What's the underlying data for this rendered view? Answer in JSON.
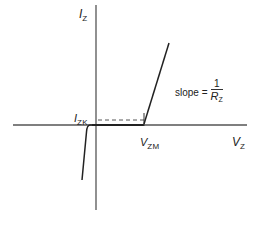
{
  "diagram": {
    "axes": {
      "y_label": {
        "main": "I",
        "sub": "Z"
      },
      "x_label": {
        "main": "V",
        "sub": "Z"
      }
    },
    "annotations": {
      "knee_current": {
        "main": "I",
        "sub": "ZK"
      },
      "knee_voltage": {
        "main": "V",
        "sub": "ZM"
      },
      "slope": {
        "prefix": "slope =",
        "numerator": "1",
        "denominator_main": "R",
        "denominator_sub": "Z"
      }
    },
    "colors": {
      "axis": "#555555",
      "curve": "#222222",
      "dashed": "#555555"
    }
  }
}
